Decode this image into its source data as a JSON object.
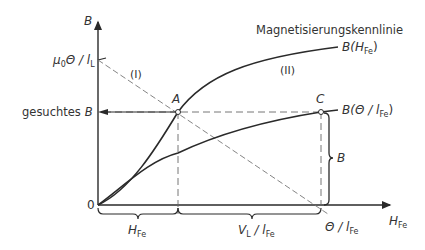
{
  "diagram": {
    "title": "Magnetisierungskennlinie",
    "axes": {
      "y_label": "B",
      "x_label": "H",
      "x_label_sub": "Fe",
      "origin_label": "0"
    },
    "y_marks": {
      "mu_label": "μ",
      "mu_sub": "0",
      "mu_rest": "Θ / l",
      "mu_rest_sub": "L",
      "sought_label": "gesuchtes",
      "sought_var": "B"
    },
    "curves": {
      "upper": {
        "roman": "(II)",
        "label": "B(H",
        "label_sub": "Fe",
        "label_end": ")"
      },
      "lower": {
        "label": "B(Θ / l",
        "label_sub": "Fe",
        "label_end": ")"
      },
      "line": {
        "roman": "(I)"
      }
    },
    "points": {
      "A": "A",
      "C": "C"
    },
    "braces": {
      "h_fe": {
        "main": "H",
        "sub": "Fe"
      },
      "v_l": {
        "main": "V",
        "sub1": "L",
        "mid": " / l",
        "sub2": "Fe"
      },
      "b": "B"
    },
    "x_marks": {
      "theta": "Θ / l",
      "theta_sub": "Fe"
    },
    "colors": {
      "ink": "#2a2a2a",
      "dashed": "#666666"
    }
  }
}
